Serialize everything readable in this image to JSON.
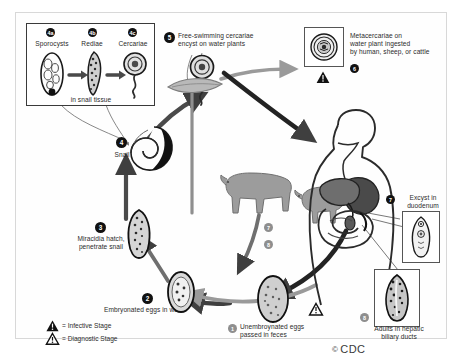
{
  "diagram": {
    "credit": "CDC",
    "credit_mark": "©"
  },
  "inset_snail_tissue": {
    "caption": "in snail tissue",
    "stages": [
      {
        "badge": "4a",
        "label": "Sporocysts"
      },
      {
        "badge": "4b",
        "label": "Rediae"
      },
      {
        "badge": "4c",
        "label": "Cercariae"
      }
    ]
  },
  "steps": [
    {
      "badge": "1",
      "label": "Unembroynated eggs\npassed in feces"
    },
    {
      "badge": "2",
      "label": "Embryonated eggs in water"
    },
    {
      "badge": "3",
      "label": "Miracidia hatch,\npenetrate snail"
    },
    {
      "badge": "4",
      "label": "Snail"
    },
    {
      "badge": "5",
      "label": "Free-swimming cercariae\nencyst on water plants"
    },
    {
      "badge": "6",
      "label": "Metacercariae on\nwater plant ingested\nby human, sheep, or cattle"
    },
    {
      "badge": "7",
      "label": "Excyst in\nduodenum"
    },
    {
      "badge": "8",
      "label": "Adults in hepatic\nbiliary ducts"
    }
  ],
  "host_route_badges": [
    {
      "badge": "7"
    },
    {
      "badge": "8"
    }
  ],
  "legend": {
    "items": [
      {
        "marker": "infective-triangle",
        "label": "= Infective Stage"
      },
      {
        "marker": "diagnostic-triangle",
        "label": "= Diagnostic Stage"
      }
    ]
  },
  "colors": {
    "ink": "#2b2b2b",
    "badge": "#111111",
    "badge_gray": "#8e8e8e",
    "arrow_dark": "#3f3f3f",
    "arrow_gray": "#9a9a9a",
    "frame": "#d8d8d8",
    "animal_fill": "#9c9c9c"
  }
}
